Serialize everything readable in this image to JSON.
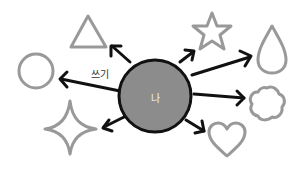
{
  "diagram": {
    "center": {
      "label": "나",
      "fill": "#8c8c8c",
      "stroke": "#111111"
    },
    "edge_label": "쓰기",
    "shapes": [
      {
        "name": "triangle"
      },
      {
        "name": "star"
      },
      {
        "name": "drop"
      },
      {
        "name": "circle"
      },
      {
        "name": "flower"
      },
      {
        "name": "sparkle"
      },
      {
        "name": "heart"
      }
    ],
    "colors": {
      "shape_stroke": "#999999",
      "arrow": "#111111"
    }
  }
}
